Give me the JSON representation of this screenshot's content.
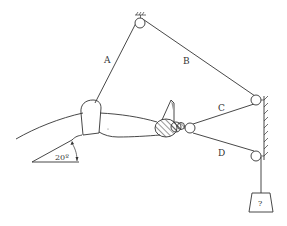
{
  "diagram": {
    "type": "biomechanics pulley system - forearm with cables",
    "labels": {
      "rope_a": "A",
      "rope_b": "B",
      "rope_c": "C",
      "rope_d": "D",
      "angle": "20º",
      "weight": "?"
    },
    "colors": {
      "line": "#333333",
      "background": "#ffffff"
    }
  }
}
